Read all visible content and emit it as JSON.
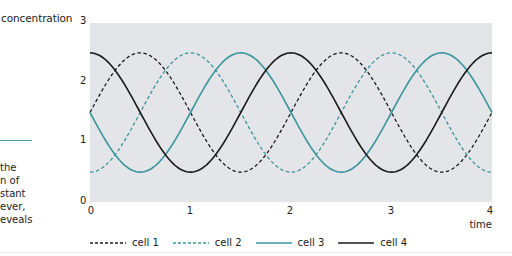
{
  "left_panel": {
    "y_axis_label": "concentration",
    "text_lines": [
      "the",
      "n of",
      "stant",
      "ever,",
      "eveals"
    ],
    "rule_color": "#4aa0a6"
  },
  "colors": {
    "plot_background": "#e3e5e8",
    "black": "#1a1a1a",
    "teal": "#3a969c"
  },
  "chart_data": {
    "type": "line",
    "title": "",
    "xlabel": "time",
    "ylabel": "concentration",
    "xlim": [
      0,
      4
    ],
    "ylim": [
      0,
      3
    ],
    "x_ticks": [
      "0",
      "1",
      "2",
      "3",
      "4"
    ],
    "y_ticks": [
      "0",
      "1",
      "2",
      "3"
    ],
    "grid": false,
    "legend_position": "bottom",
    "period": 2,
    "mean": 1.5,
    "amplitude": 1.0,
    "series": [
      {
        "name": "cell 1",
        "color": "#1a1a1a",
        "style": "dashed",
        "peak_time": 0.5,
        "x": [
          0,
          0.5,
          1,
          1.5,
          2,
          2.5,
          3,
          3.5,
          4
        ],
        "values": [
          1.5,
          2.5,
          1.5,
          0.5,
          1.5,
          2.5,
          1.5,
          0.5,
          1.5
        ]
      },
      {
        "name": "cell 2",
        "color": "#3a969c",
        "style": "dashed",
        "peak_time": 1.0,
        "x": [
          0,
          0.5,
          1,
          1.5,
          2,
          2.5,
          3,
          3.5,
          4
        ],
        "values": [
          0.5,
          1.5,
          2.5,
          1.5,
          0.5,
          1.5,
          2.5,
          1.5,
          0.5
        ]
      },
      {
        "name": "cell 3",
        "color": "#3a969c",
        "style": "solid",
        "peak_time": 1.5,
        "x": [
          0,
          0.5,
          1,
          1.5,
          2,
          2.5,
          3,
          3.5,
          4
        ],
        "values": [
          1.5,
          0.5,
          1.5,
          2.5,
          1.5,
          0.5,
          1.5,
          2.5,
          1.5
        ]
      },
      {
        "name": "cell 4",
        "color": "#1a1a1a",
        "style": "solid",
        "peak_time": 0.0,
        "x": [
          0,
          0.5,
          1,
          1.5,
          2,
          2.5,
          3,
          3.5,
          4
        ],
        "values": [
          2.5,
          1.5,
          0.5,
          1.5,
          2.5,
          1.5,
          0.5,
          1.5,
          2.5
        ]
      }
    ]
  },
  "legend": {
    "items": [
      {
        "label": "cell 1"
      },
      {
        "label": "cell 2"
      },
      {
        "label": "cell 3"
      },
      {
        "label": "cell 4"
      }
    ]
  }
}
